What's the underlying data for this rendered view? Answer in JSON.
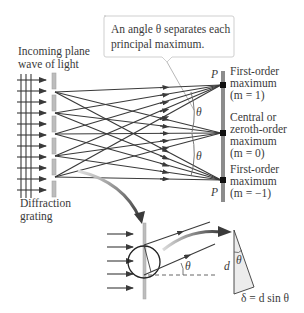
{
  "diagram": {
    "callout": {
      "line1": "An angle θ separates each",
      "line2": "principal maximum."
    },
    "incoming_label": {
      "line1": "Incoming plane",
      "line2": "wave of light"
    },
    "grating_label": {
      "line1": "Diffraction",
      "line2": "grating"
    },
    "screen_point_label": "P",
    "angle_label": "θ",
    "maxima": [
      {
        "line1": "First-order",
        "line2": "maximum",
        "line3": "(m = 1)"
      },
      {
        "line1": "Central or",
        "line2": "zeroth-order",
        "line3": "maximum",
        "line4": "(m = 0)"
      },
      {
        "line1": "First-order",
        "line2": "maximum",
        "line3": "(m = −1)"
      }
    ],
    "inset": {
      "angle_label": "θ",
      "triangle_side_label": "d",
      "triangle_angle_label": "θ",
      "path_difference": "δ = d sin θ"
    },
    "colors": {
      "ray": "#3a3a3a",
      "grating": "#b5b5b5",
      "screen": "#8c8c8c",
      "focus": "#111111",
      "callout_border": "#cfcfcf",
      "triangle_fill": "#ececec"
    }
  }
}
